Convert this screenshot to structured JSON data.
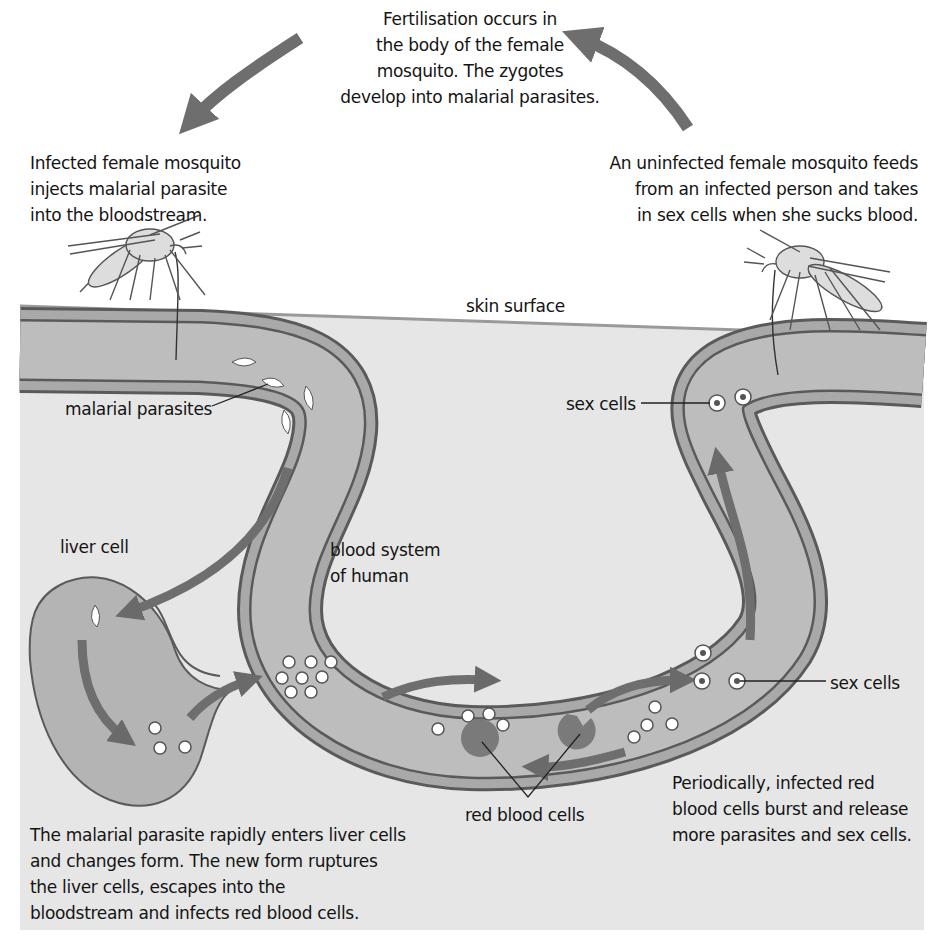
{
  "diagram": {
    "title_caption": {
      "lines": [
        "Fertilisation occurs in",
        "the body of the female",
        "mosquito. The zygotes",
        "develop into malarial parasites."
      ]
    },
    "left_caption": {
      "lines": [
        "Infected female mosquito",
        "injects malarial parasite",
        "into the bloodstream."
      ]
    },
    "right_caption": {
      "lines": [
        "An uninfected female mosquito feeds",
        "from an infected person and takes",
        "in sex cells when she sucks blood."
      ]
    },
    "labels": {
      "skin_surface": "skin surface",
      "malarial_parasites": "malarial parasites",
      "sex_cells_top": "sex cells",
      "liver_cell": "liver cell",
      "blood_system": [
        "blood system",
        "of human"
      ],
      "sex_cells_right": "sex cells",
      "red_blood_cells": "red blood cells"
    },
    "bottom_left_caption": {
      "lines": [
        "The malarial parasite rapidly enters liver cells",
        "and changes form. The new form ruptures",
        "the liver cells, escapes into the",
        "bloodstream and infects red blood cells."
      ]
    },
    "bottom_right_caption": {
      "lines": [
        "Periodically, infected red",
        "blood cells burst and release",
        "more parasites and sex cells."
      ]
    },
    "icons": [
      "mosquito-infected-icon",
      "mosquito-uninfected-icon",
      "cycle-arrow-icon",
      "parasite-icon",
      "sex-cell-icon",
      "red-blood-cell-icon",
      "liver-cell-icon"
    ],
    "colors": {
      "background": "#ffffff",
      "tissue": "#e6e6e6",
      "vessel_wall": "#a9a9a9",
      "vessel_line": "#5a5a5a",
      "vessel_lumen": "#bdbdbd",
      "arrow": "#6e6e6e",
      "red_blood_cell": "#7a7a7a",
      "text": "#141414"
    }
  }
}
